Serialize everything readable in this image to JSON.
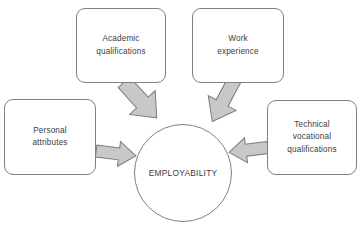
{
  "diagram": {
    "type": "hub-and-spoke",
    "background_color": "#ffffff",
    "box_border_color": "#808080",
    "arrow_fill_color": "#c8c8c8",
    "arrow_border_color": "#7a7a7a",
    "text_color": "#3c3c3c",
    "hub": {
      "shape": "circle",
      "label": "EMPLOYABILITY"
    },
    "nodes": [
      {
        "id": "academic",
        "lines": [
          "Academic",
          "qualifications"
        ],
        "position": "top-left",
        "arrow_direction": "down-right"
      },
      {
        "id": "work",
        "lines": [
          "Work",
          "experience"
        ],
        "position": "top-right",
        "arrow_direction": "down-left"
      },
      {
        "id": "personal",
        "lines": [
          "Personal",
          "attributes"
        ],
        "position": "left",
        "arrow_direction": "right"
      },
      {
        "id": "technical",
        "lines": [
          "Technical",
          "vocational",
          "qualifications"
        ],
        "position": "right",
        "arrow_direction": "left"
      }
    ]
  }
}
